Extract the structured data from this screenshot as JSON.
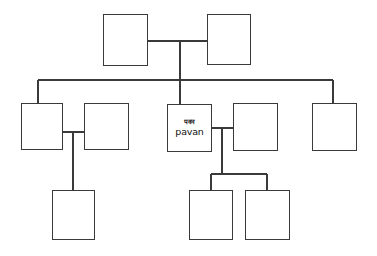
{
  "diagram": {
    "type": "family-tree",
    "background_color": "#ffffff",
    "line_color": "#3a3a3a",
    "box_fill_color": "#ffffff",
    "canvas": {
      "width": 377,
      "height": 256
    },
    "generations": 3,
    "nodes": [
      {
        "id": "g1-left",
        "name": "generation1-box-left",
        "generation": 1,
        "label_native": "",
        "label_latin": "",
        "x": 103,
        "y": 14,
        "w": 45,
        "h": 52
      },
      {
        "id": "g1-right",
        "name": "generation1-box-right",
        "generation": 1,
        "label_native": "",
        "label_latin": "",
        "x": 207,
        "y": 14,
        "w": 44,
        "h": 51
      },
      {
        "id": "g2-a",
        "name": "generation2-box-1",
        "generation": 2,
        "label_native": "",
        "label_latin": "",
        "x": 21,
        "y": 103,
        "w": 42,
        "h": 47
      },
      {
        "id": "g2-b",
        "name": "generation2-box-2",
        "generation": 2,
        "label_native": "",
        "label_latin": "",
        "x": 84,
        "y": 103,
        "w": 45,
        "h": 47
      },
      {
        "id": "g2-pavan",
        "name": "generation2-box-pavan",
        "generation": 2,
        "label_native": "पवन",
        "label_latin": "pavan",
        "x": 167,
        "y": 104,
        "w": 45,
        "h": 48
      },
      {
        "id": "g2-d",
        "name": "generation2-box-4",
        "generation": 2,
        "label_native": "",
        "label_latin": "",
        "x": 233,
        "y": 103,
        "w": 45,
        "h": 48
      },
      {
        "id": "g2-e",
        "name": "generation2-box-5",
        "generation": 2,
        "label_native": "",
        "label_latin": "",
        "x": 312,
        "y": 103,
        "w": 45,
        "h": 48
      },
      {
        "id": "g3-a",
        "name": "generation3-box-1",
        "generation": 3,
        "label_native": "",
        "label_latin": "",
        "x": 52,
        "y": 190,
        "w": 43,
        "h": 50
      },
      {
        "id": "g3-b",
        "name": "generation3-box-2",
        "generation": 3,
        "label_native": "",
        "label_latin": "",
        "x": 189,
        "y": 190,
        "w": 44,
        "h": 50
      },
      {
        "id": "g3-c",
        "name": "generation3-box-3",
        "generation": 3,
        "label_native": "",
        "label_latin": "",
        "x": 245,
        "y": 190,
        "w": 45,
        "h": 50
      }
    ],
    "connectors": [
      {
        "name": "spouse-link-generation1",
        "type": "spouse",
        "points": "148,41 207,41"
      },
      {
        "name": "trunk-drop-generation1",
        "type": "descent",
        "points": "180,41 180,80"
      },
      {
        "name": "sibling-bus-generation2",
        "type": "sibling-bus",
        "points": "38,80 333,80"
      },
      {
        "name": "drop-to-generation2-box-1",
        "type": "descent",
        "points": "38,80 38,103"
      },
      {
        "name": "drop-to-generation2-box-pavan",
        "type": "descent",
        "points": "180,80 180,104"
      },
      {
        "name": "drop-to-generation2-box-5",
        "type": "descent",
        "points": "333,80 333,103"
      },
      {
        "name": "spouse-link-generation2-left-pair",
        "type": "spouse",
        "points": "63,132 84,132"
      },
      {
        "name": "child-drop-generation2-left-pair",
        "type": "descent",
        "points": "73,132 73,190"
      },
      {
        "name": "spouse-link-generation2-pavan-pair",
        "type": "spouse",
        "points": "212,128 233,128"
      },
      {
        "name": "child-drop-generation2-pavan-pair",
        "type": "descent",
        "points": "222,128 222,174"
      },
      {
        "name": "sibling-bus-generation3",
        "type": "sibling-bus",
        "points": "211,174 267,174"
      },
      {
        "name": "drop-to-generation3-box-2",
        "type": "descent",
        "points": "211,174 211,190"
      },
      {
        "name": "drop-to-generation3-box-3",
        "type": "descent",
        "points": "267,174 267,190"
      }
    ]
  }
}
